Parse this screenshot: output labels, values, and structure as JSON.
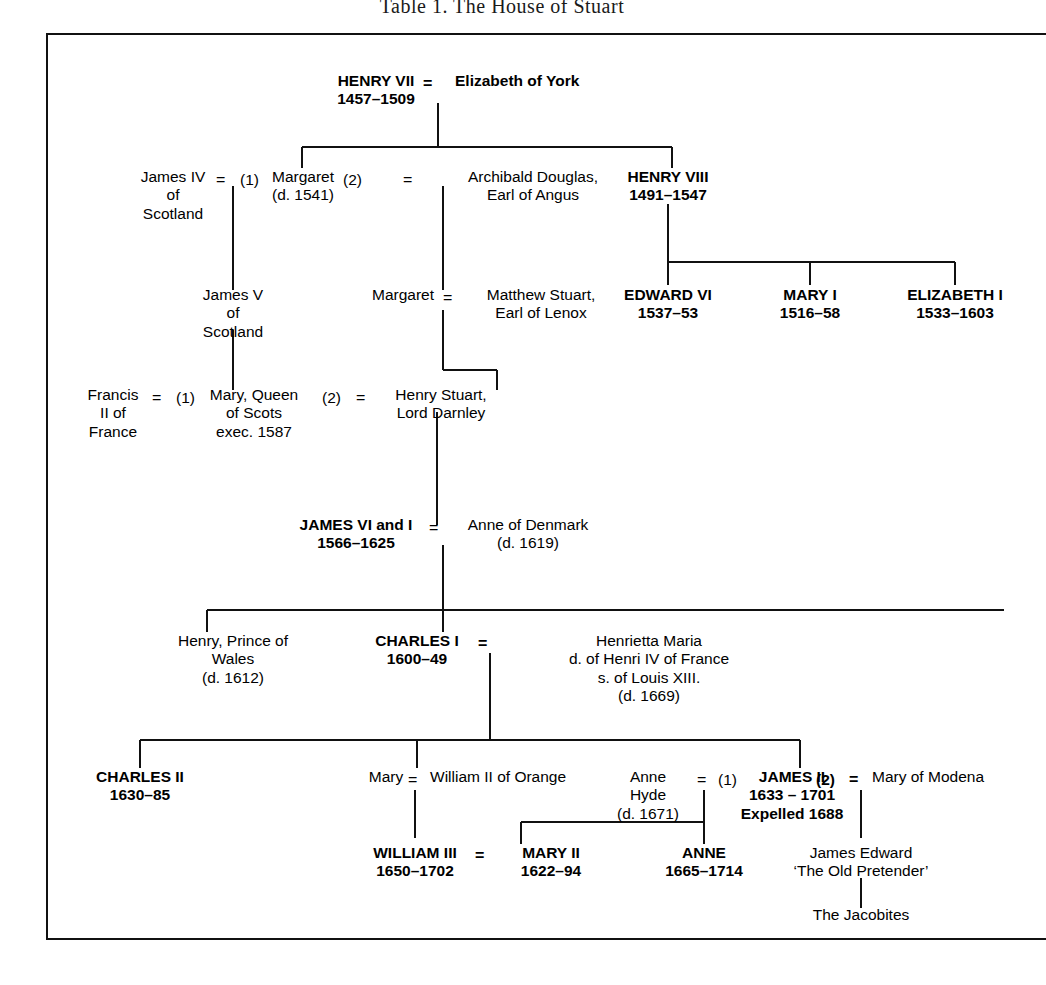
{
  "document": {
    "title": "Table 1.  The House of Stuart",
    "kind": "genealogical-chart",
    "frame_color": "#111111",
    "text_color": "#000000",
    "background": "#ffffff"
  },
  "symbols": {
    "marriage": "=",
    "first_marriage": "(1)",
    "second_marriage": "(2)"
  },
  "people": {
    "henry7": {
      "name": "HENRY VII",
      "dates": "1457–1509"
    },
    "elizabeth_york": {
      "name": "Elizabeth of York",
      "dates": ""
    },
    "james4": {
      "name": "James IV",
      "line2": "of",
      "line3": "Scotland"
    },
    "margaret": {
      "name": "Margaret",
      "dates": "(d. 1541)"
    },
    "archibald": {
      "name": "Archibald Douglas,",
      "line2": "Earl of Angus"
    },
    "henry8": {
      "name": "HENRY VIII",
      "dates": "1491–1547"
    },
    "james5": {
      "name": "James V",
      "line2": "of",
      "line3": "Scotland"
    },
    "margaret2": {
      "name": "Margaret",
      "dates": ""
    },
    "matthew": {
      "name": "Matthew Stuart,",
      "line2": "Earl of Lenox"
    },
    "edward6": {
      "name": "EDWARD VI",
      "dates": "1537–53"
    },
    "mary1": {
      "name": "MARY I",
      "dates": "1516–58"
    },
    "elizabeth1": {
      "name": "ELIZABETH I",
      "dates": "1533–1603"
    },
    "francis2": {
      "name": "Francis",
      "line2": "II of",
      "line3": "France"
    },
    "mary_scots": {
      "name": "Mary, Queen",
      "line2": "of Scots",
      "line3": "exec. 1587"
    },
    "darnley": {
      "name": "Henry Stuart,",
      "line2": "Lord Darnley"
    },
    "james6": {
      "name": "JAMES VI and I",
      "dates": "1566–1625"
    },
    "anne_denmark": {
      "name": "Anne of Denmark",
      "dates": "(d. 1619)"
    },
    "henry_wales": {
      "name": "Henry, Prince of",
      "line2": "Wales",
      "line3": "(d. 1612)"
    },
    "charles1": {
      "name": "CHARLES I",
      "dates": "1600–49"
    },
    "henrietta": {
      "name": "Henrietta Maria",
      "line2": "d. of Henri IV of France",
      "line3": "s. of Louis XIII.",
      "line4": "(d. 1669)"
    },
    "charles2": {
      "name": "CHARLES II",
      "dates": "1630–85"
    },
    "mary_stuart": {
      "name": "Mary",
      "dates": ""
    },
    "william2": {
      "name": "William II of Orange",
      "dates": ""
    },
    "anne_hyde": {
      "name": "Anne",
      "line2": "Hyde",
      "line3": "(d. 1671)"
    },
    "james2": {
      "name": "JAMES II",
      "dates": "1633 – 1701",
      "note": "Expelled 1688"
    },
    "mary_modena": {
      "name": "Mary of Modena",
      "dates": ""
    },
    "william3": {
      "name": "WILLIAM III",
      "dates": "1650–1702"
    },
    "mary2": {
      "name": "MARY II",
      "dates": "1622–94"
    },
    "anne": {
      "name": "ANNE",
      "dates": "1665–1714"
    },
    "james_edward": {
      "name": "James Edward",
      "line2": "‘The Old Pretender’"
    },
    "jacobites": {
      "name": "The Jacobites",
      "dates": ""
    }
  }
}
